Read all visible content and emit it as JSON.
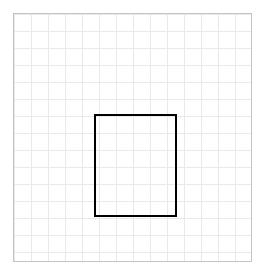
{
  "canvas": {
    "width": 267,
    "height": 278,
    "background_color": "#ffffff"
  },
  "grid": {
    "label": "graph-paper-grid",
    "x": 13,
    "y": 13,
    "width": 239,
    "height": 249,
    "columns": 14,
    "rows": 15,
    "cell_size": 17,
    "line_color": "#e9e9e9",
    "line_width": 1,
    "border_color": "#c4c4c4",
    "border_width": 1,
    "fill_color": "#ffffff"
  },
  "shapes": [
    {
      "name": "black-rectangle",
      "type": "rectangle",
      "x": 94,
      "y": 114,
      "width": 83,
      "height": 103,
      "stroke_color": "#000000",
      "stroke_width": 2,
      "fill": "none",
      "grid_column_start": 5,
      "grid_column_end": 10,
      "grid_row_start": 6,
      "grid_row_end": 12,
      "grid_cells_wide": 5,
      "grid_cells_tall": 6
    }
  ],
  "chart_data": {
    "type": "table",
    "title": "",
    "xlabel": "",
    "ylabel": "",
    "grid": true,
    "legend": "none",
    "categories": [],
    "values": []
  }
}
